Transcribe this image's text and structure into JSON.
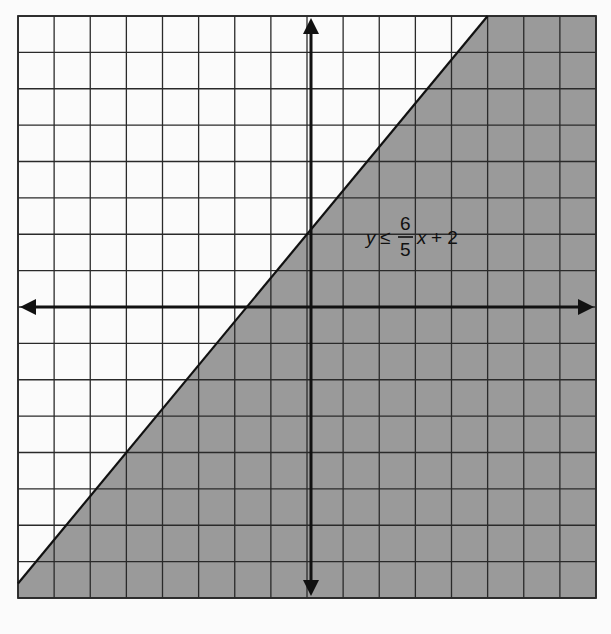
{
  "chart_data": {
    "type": "inequality-graph",
    "title": "",
    "inequality": {
      "label_y": "y",
      "label_op": "≤",
      "label_num": "6",
      "label_den": "5",
      "label_x": "x",
      "label_tail": "+ 2",
      "full_text": "y ≤ 6/5 x + 2",
      "slope": 1.2,
      "intercept": 2,
      "boundary": "solid",
      "shaded_region": "below"
    },
    "xlim": [
      -8,
      8
    ],
    "ylim": [
      -8,
      8
    ],
    "grid": true,
    "grid_step": 1,
    "xlabel": "",
    "ylabel": "",
    "tick_labels": "none",
    "colors": {
      "background": "#fbfbfb",
      "grid_line": "#2a2a2a",
      "shade": "#9a9a9a",
      "axis": "#111111"
    }
  }
}
